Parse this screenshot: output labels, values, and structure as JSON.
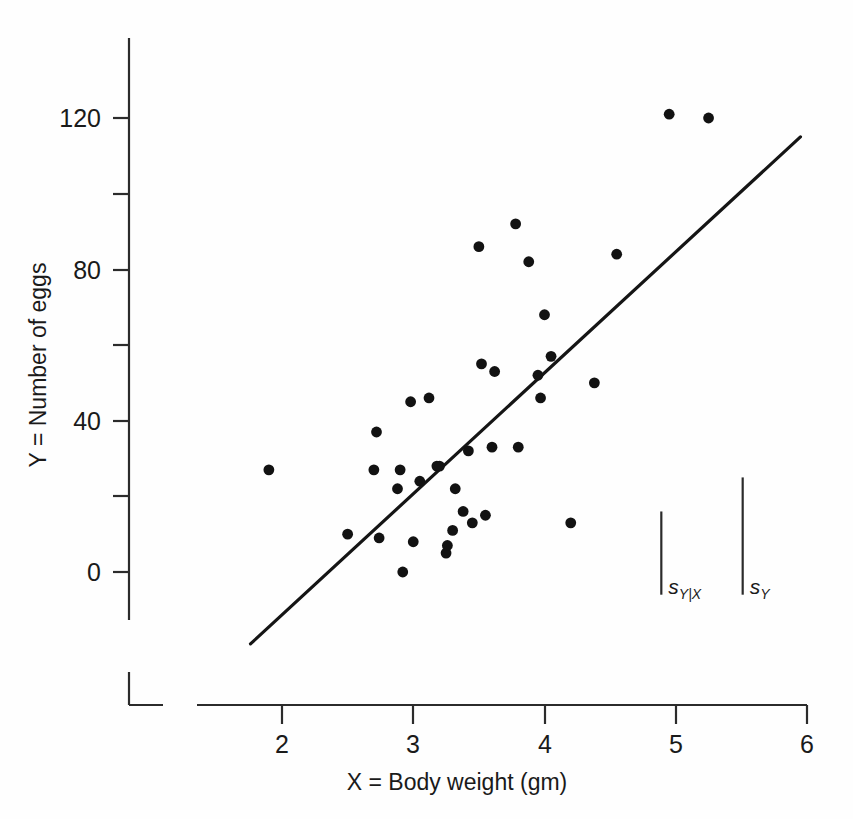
{
  "chart_data": {
    "type": "scatter",
    "title": "",
    "xlabel": "X = Body weight (gm)",
    "ylabel": "Y = Number of eggs",
    "xlim": [
      1.45,
      6.0
    ],
    "ylim": [
      -20,
      135
    ],
    "grid": false,
    "legend": "none",
    "x_ticks": [
      2,
      3,
      4,
      5,
      6
    ],
    "x_tick_labels": [
      "2",
      "3",
      "4",
      "5",
      "6"
    ],
    "y_ticks": [
      0,
      20,
      40,
      60,
      80,
      100,
      120
    ],
    "y_tick_labels": [
      "0",
      "",
      "40",
      "",
      "80",
      "",
      "120"
    ],
    "y_major_labels": [
      "0",
      "40",
      "80",
      "120"
    ],
    "points": [
      {
        "x": 1.9,
        "y": 27
      },
      {
        "x": 2.5,
        "y": 10
      },
      {
        "x": 2.7,
        "y": 27
      },
      {
        "x": 2.72,
        "y": 37
      },
      {
        "x": 2.74,
        "y": 9
      },
      {
        "x": 2.88,
        "y": 22
      },
      {
        "x": 2.9,
        "y": 27
      },
      {
        "x": 2.92,
        "y": 0
      },
      {
        "x": 2.98,
        "y": 45
      },
      {
        "x": 3.0,
        "y": 8
      },
      {
        "x": 3.05,
        "y": 24
      },
      {
        "x": 3.12,
        "y": 46
      },
      {
        "x": 3.18,
        "y": 28
      },
      {
        "x": 3.2,
        "y": 28
      },
      {
        "x": 3.25,
        "y": 5
      },
      {
        "x": 3.26,
        "y": 7
      },
      {
        "x": 3.3,
        "y": 11
      },
      {
        "x": 3.32,
        "y": 22
      },
      {
        "x": 3.38,
        "y": 16
      },
      {
        "x": 3.42,
        "y": 32
      },
      {
        "x": 3.45,
        "y": 13
      },
      {
        "x": 3.5,
        "y": 86
      },
      {
        "x": 3.52,
        "y": 55
      },
      {
        "x": 3.55,
        "y": 15
      },
      {
        "x": 3.6,
        "y": 33
      },
      {
        "x": 3.62,
        "y": 53
      },
      {
        "x": 3.78,
        "y": 92
      },
      {
        "x": 3.8,
        "y": 33
      },
      {
        "x": 3.88,
        "y": 82
      },
      {
        "x": 3.95,
        "y": 52
      },
      {
        "x": 3.97,
        "y": 46
      },
      {
        "x": 4.0,
        "y": 68
      },
      {
        "x": 4.05,
        "y": 57
      },
      {
        "x": 4.2,
        "y": 13
      },
      {
        "x": 4.38,
        "y": 50
      },
      {
        "x": 4.55,
        "y": 84
      },
      {
        "x": 4.95,
        "y": 121
      },
      {
        "x": 5.25,
        "y": 120
      }
    ],
    "regression_line": {
      "x_start": 1.76,
      "y_start": -19,
      "x_end": 5.95,
      "y_end": 115,
      "label": "least-squares regression line"
    },
    "annotations": [
      {
        "name": "s-y-given-x-bar",
        "label_main": "s",
        "label_sub": "Y|X",
        "x": 4.89,
        "y_bottom": -6,
        "y_top": 16
      },
      {
        "name": "s-y-bar",
        "label_main": "s",
        "label_sub": "Y",
        "x": 5.51,
        "y_bottom": -6,
        "y_top": 25
      }
    ]
  }
}
